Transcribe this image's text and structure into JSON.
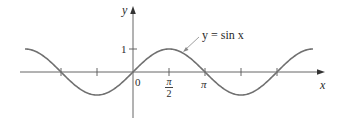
{
  "chart_data": {
    "type": "line",
    "title": "",
    "function": "y = sin x",
    "xlabel": "x",
    "ylabel": "y",
    "series": [
      {
        "name": "y = sin x",
        "x_range": [
          "-3π/2",
          "5π/2"
        ],
        "x": [
          -4.712,
          -3.927,
          -3.142,
          -2.356,
          -1.571,
          -0.785,
          0,
          0.785,
          1.571,
          2.356,
          3.142,
          3.927,
          4.712,
          5.498,
          6.283,
          7.069,
          7.854
        ],
        "values": [
          1,
          0.707,
          0,
          -0.707,
          -1,
          -0.707,
          0,
          0.707,
          1,
          0.707,
          0,
          -0.707,
          -1,
          -0.707,
          0,
          0.707,
          1
        ]
      }
    ],
    "x_ticks": [
      "-π",
      "-π/2",
      "0",
      "π/2",
      "π",
      "3π/2",
      "2π"
    ],
    "x_tick_labels": [
      "0",
      "π/2",
      "π"
    ],
    "y_ticks": [
      1
    ],
    "y_tick_labels": [
      "1"
    ],
    "xlim": [
      -4.9,
      8.3
    ],
    "ylim": [
      -1.4,
      3.1
    ],
    "grid": false,
    "annotations": [
      {
        "text": "y = sin x",
        "points_to": "curve near x ≈ 2.0"
      }
    ]
  },
  "labels": {
    "y_axis": "y",
    "x_axis": "x",
    "y_one": "1",
    "origin": "0",
    "pi_half_num": "π",
    "pi_half_den": "2",
    "pi": "π",
    "curve_label": "y = sin x"
  },
  "colors": {
    "curve": "#707070",
    "axes": "#555555",
    "text": "#2a2a2a"
  }
}
